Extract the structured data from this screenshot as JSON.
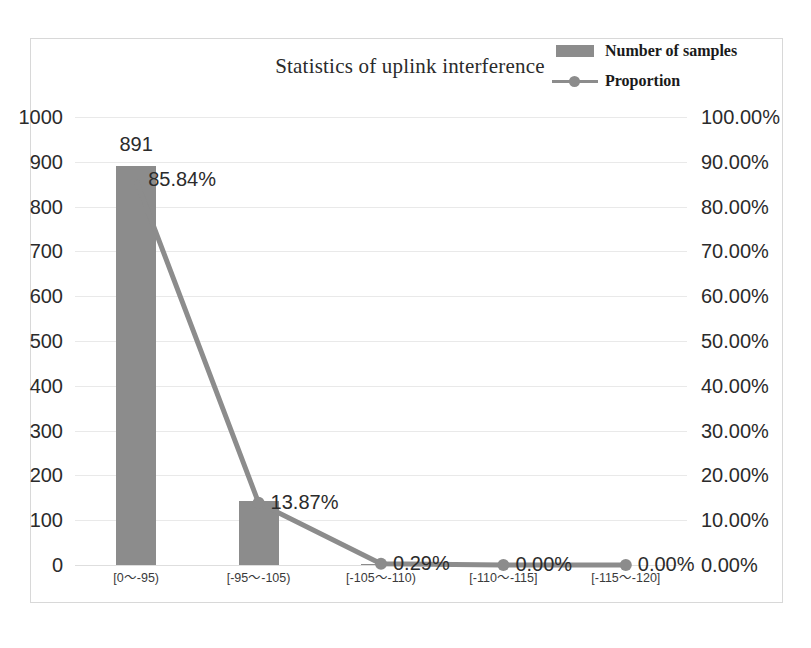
{
  "chart_data": {
    "type": "bar",
    "title": "Statistics of uplink interference",
    "xlabel": "",
    "ylabel": "",
    "categories": [
      "[0～-95)",
      "[-95～-105)",
      "[-105～-110)",
      "[-110～-115]",
      "[-115～-120]"
    ],
    "grid": true,
    "legend_position": "top-right",
    "series": [
      {
        "name": "Number of samples",
        "type": "bar",
        "axis": "left",
        "color": "#8c8c8c",
        "values": [
          891,
          144,
          3,
          0,
          0
        ],
        "data_labels": [
          "891",
          "",
          "",
          "",
          ""
        ]
      },
      {
        "name": "Proportion",
        "type": "line",
        "axis": "right",
        "color": "#8c8c8c",
        "values": [
          85.84,
          13.87,
          0.29,
          0.0,
          0.0
        ],
        "data_labels": [
          "85.84%",
          "13.87%",
          "0.29%",
          "0.00%",
          "0.00%"
        ]
      }
    ],
    "left_axis": {
      "min": 0,
      "max": 1000,
      "step": 100,
      "ticks": [
        "0",
        "100",
        "200",
        "300",
        "400",
        "500",
        "600",
        "700",
        "800",
        "900",
        "1000"
      ]
    },
    "right_axis": {
      "min": 0,
      "max": 100,
      "step": 10,
      "ticks": [
        "0.00%",
        "10.00%",
        "20.00%",
        "30.00%",
        "40.00%",
        "50.00%",
        "60.00%",
        "70.00%",
        "80.00%",
        "90.00%",
        "100.00%"
      ]
    }
  },
  "legend": {
    "items": [
      {
        "label": "Number of samples",
        "swatch": "bar-swatch"
      },
      {
        "label": "Proportion",
        "swatch": "line-marker-swatch"
      }
    ]
  },
  "caption": {
    "text": ""
  }
}
